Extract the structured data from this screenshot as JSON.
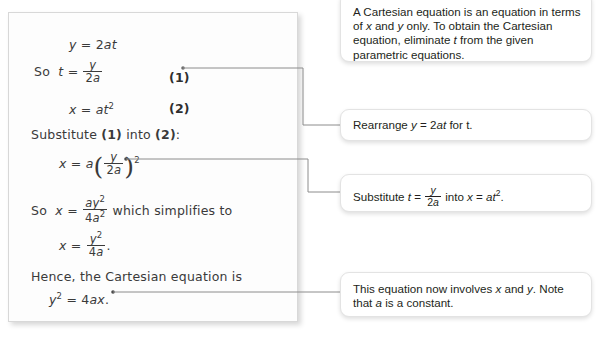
{
  "solution": {
    "lines": [
      {
        "id": "line-y-equals-2at",
        "text": "y = 2at"
      },
      {
        "id": "line-so-t-equals",
        "prefix": "So",
        "text": "t = y/(2a)",
        "tag": "(1)"
      },
      {
        "id": "line-x-equals-at2",
        "text": "x = at²",
        "tag": "(2)"
      },
      {
        "id": "line-substitute-1-into-2",
        "text": "Substitute (1) into (2):"
      },
      {
        "id": "line-x-equals-a-y-over-2a-squared",
        "text": "x = a(y/(2a))²"
      },
      {
        "id": "line-so-x-equals-ay2-over-4a2",
        "prefix": "So",
        "text": "x = ay²/(4a²) which simplifies to"
      },
      {
        "id": "line-x-equals-y2-over-4a",
        "text": "x = y²/(4a)."
      },
      {
        "id": "line-hence-cartesian",
        "text": "Hence, the Cartesian equation is"
      },
      {
        "id": "line-y2-equals-4ax",
        "text": "y² = 4ax."
      }
    ],
    "labels": {
      "so": "So",
      "substitute_intro": "Substitute (1) into (2):",
      "which_simplifies": "which simplifies to",
      "hence": "Hence, the Cartesian equation is"
    },
    "tags": {
      "one": "(1)",
      "two": "(2)"
    },
    "symbols": {
      "y": "y",
      "x": "x",
      "t": "t",
      "a": "a",
      "equals": "=",
      "two": "2",
      "four": "4",
      "2a": "2a",
      "4a": "4a",
      "at": "at",
      "ax": "ax",
      "ay": "ay",
      "4a2": "4a"
    }
  },
  "notes": [
    {
      "id": "note-cartesian-definition",
      "parts": [
        "A Cartesian equation is an equation in terms",
        "of x and y only. To obtain the Cartesian",
        "equation, eliminate t from the given",
        "parametric equations."
      ]
    },
    {
      "id": "note-rearrange",
      "text_before": "Rearrange ",
      "equation": "y = 2at",
      "text_after": " for t."
    },
    {
      "id": "note-substitute",
      "text_before": "Substitute ",
      "t_label": "t",
      "equals": "=",
      "frac_num": "y",
      "frac_den": "2a",
      "middle": " into ",
      "x_label": "x",
      "rhs": "at",
      "rhs_sup": "2",
      "period": "."
    },
    {
      "id": "note-involves-x-and-y",
      "parts": [
        "This equation now involves x and y. Note",
        "that a is a constant."
      ]
    }
  ],
  "connectors": [
    {
      "id": "connector-eq1-to-rearrange",
      "from": "tag-one",
      "to": "note-rearrange"
    },
    {
      "id": "connector-substituted-to-substitute",
      "from": "line-x-equals-a-y-over-2a-squared",
      "to": "note-substitute"
    },
    {
      "id": "connector-final-to-involves",
      "from": "line-y2-equals-4ax",
      "to": "note-involves-x-and-y"
    }
  ],
  "colors": {
    "page_background": "#ffffff",
    "card_background": "#fdfdfd",
    "card_border": "#d8d8d8",
    "note_border": "#e3e3e3",
    "ink": "#3a3a3a",
    "note_text": "#231f20",
    "connector": "#8c8c8c"
  }
}
